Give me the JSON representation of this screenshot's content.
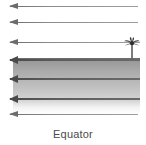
{
  "figure": {
    "caption": "Equator",
    "band": {
      "label": "tropical-zone-band",
      "top_color": "#8f8f8f",
      "bottom_color": "#d2d2d2",
      "border_color": "#6e6e6e"
    },
    "palm_tree": {
      "label": "palm-tree",
      "frond_color": "#3a3a3a",
      "trunk_color": "#5a5a5a"
    },
    "rays": [
      {
        "id": "ray-1",
        "y": 6,
        "x_start": 10,
        "x_end": 138,
        "emphasis": "normal"
      },
      {
        "id": "ray-2",
        "y": 22,
        "x_start": 10,
        "x_end": 138,
        "emphasis": "normal"
      },
      {
        "id": "ray-3",
        "y": 42,
        "x_start": 10,
        "x_end": 140,
        "emphasis": "normal"
      },
      {
        "id": "ray-4",
        "y": 59,
        "x_start": 10,
        "x_end": 140,
        "emphasis": "dark"
      },
      {
        "id": "ray-5",
        "y": 78,
        "x_start": 10,
        "x_end": 140,
        "emphasis": "dark"
      },
      {
        "id": "ray-6",
        "y": 98,
        "x_start": 10,
        "x_end": 140,
        "emphasis": "dark"
      },
      {
        "id": "ray-7",
        "y": 114,
        "x_start": 10,
        "x_end": 138,
        "emphasis": "normal"
      }
    ],
    "ray_direction": "left",
    "ray_color": "#6d6d6d",
    "background_color": "#ffffff"
  }
}
